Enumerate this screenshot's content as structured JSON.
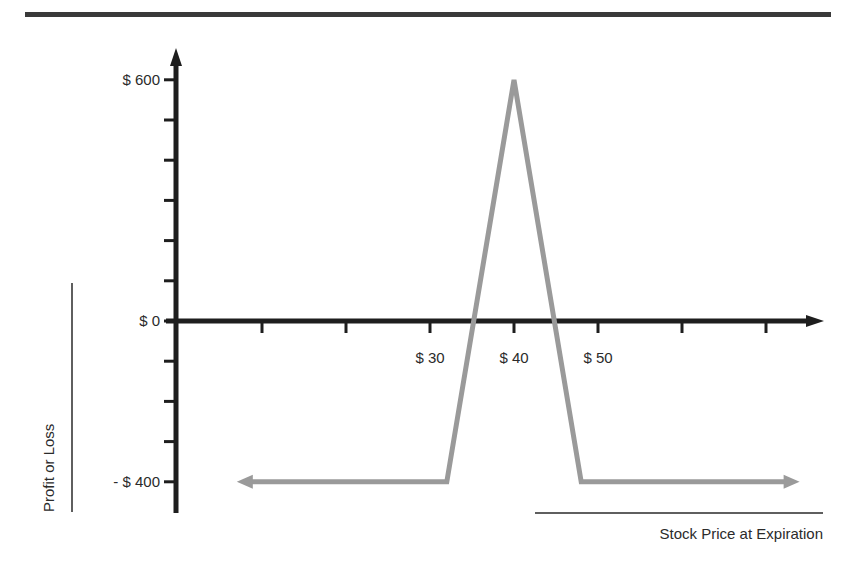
{
  "chart_data": {
    "type": "line",
    "title": "",
    "xlabel": "Stock Price at Expiration",
    "ylabel": "Profit or Loss",
    "x_tick_labels": [
      {
        "value": 30,
        "label": "$ 30"
      },
      {
        "value": 40,
        "label": "$ 40"
      },
      {
        "value": 50,
        "label": "$ 50"
      }
    ],
    "y_tick_labels": [
      {
        "value": 600,
        "label": "$ 600"
      },
      {
        "value": 0,
        "label": "$ 0"
      },
      {
        "value": -400,
        "label": "- $ 400"
      }
    ],
    "x_ticks": [
      10,
      20,
      30,
      40,
      50,
      60,
      70
    ],
    "y_ticks": [
      600,
      500,
      400,
      300,
      200,
      100,
      0,
      -100,
      -200,
      -300,
      -400
    ],
    "xlim": [
      0,
      77
    ],
    "ylim": [
      -450,
      670
    ],
    "grid": false,
    "legend": null,
    "series": [
      {
        "name": "Payoff",
        "color": "#9a9a9a",
        "x": [
          7,
          32,
          40,
          48,
          74
        ],
        "y": [
          -400,
          -400,
          600,
          -400,
          -400
        ],
        "arrows": [
          "left-end",
          "right-end"
        ]
      }
    ]
  },
  "colors": {
    "axis": "#1e1e1e",
    "payoff_line": "#9a9a9a",
    "header_rule": "#3a3a3a"
  }
}
